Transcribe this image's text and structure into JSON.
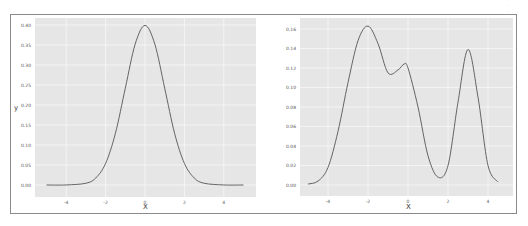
{
  "chart_data": [
    {
      "type": "line",
      "title": "",
      "xlabel": "X",
      "ylabel": "y",
      "xlim": [
        -5.5,
        5.5
      ],
      "ylim": [
        -0.01,
        0.42
      ],
      "grid": true,
      "x_ticks": [
        "-4",
        "-2",
        "0",
        "2",
        "4"
      ],
      "y_ticks": [
        "0.00",
        "0.05",
        "0.10",
        "0.15",
        "0.20",
        "0.25",
        "0.30",
        "0.35",
        "0.40"
      ],
      "series": [
        {
          "name": "standard normal density",
          "x": [
            -5,
            -4,
            -3,
            -2.5,
            -2,
            -1.5,
            -1,
            -0.5,
            0,
            0.5,
            1,
            1.5,
            2,
            2.5,
            3,
            4,
            5
          ],
          "y": [
            0.0,
            0.0001,
            0.0044,
            0.0175,
            0.054,
            0.1295,
            0.242,
            0.352,
            0.399,
            0.352,
            0.242,
            0.1295,
            0.054,
            0.0175,
            0.0044,
            0.0001,
            0.0
          ]
        }
      ]
    },
    {
      "type": "line",
      "title": "",
      "xlabel": "X",
      "ylabel": "",
      "xlim": [
        -5.5,
        5.5
      ],
      "ylim": [
        -0.005,
        0.17
      ],
      "grid": true,
      "x_ticks": [
        "-4",
        "-2",
        "0",
        "2",
        "4"
      ],
      "y_ticks": [
        "0.00",
        "0.02",
        "0.04",
        "0.06",
        "0.08",
        "0.10",
        "0.12",
        "0.14",
        "0.16"
      ],
      "series": [
        {
          "name": "trimodal mixture density",
          "x": [
            -5,
            -4.5,
            -4,
            -3.5,
            -3,
            -2.5,
            -2,
            -1.5,
            -1,
            -0.5,
            -0.2,
            0,
            0.5,
            1,
            1.5,
            2,
            2.5,
            3,
            3.5,
            4,
            4.5
          ],
          "y": [
            0.001,
            0.004,
            0.018,
            0.055,
            0.105,
            0.148,
            0.163,
            0.145,
            0.115,
            0.118,
            0.124,
            0.12,
            0.08,
            0.03,
            0.008,
            0.02,
            0.085,
            0.139,
            0.09,
            0.02,
            0.003
          ]
        }
      ]
    }
  ],
  "left_panel": {
    "ylabel": "y",
    "xlabel": "X",
    "y_ticks": [
      "0.40",
      "0.35",
      "0.30",
      "0.25",
      "0.20",
      "0.15",
      "0.10",
      "0.05",
      "0.00"
    ],
    "x_ticks": [
      "-4",
      "-2",
      "0",
      "2",
      "4"
    ]
  },
  "right_panel": {
    "xlabel": "X",
    "y_ticks": [
      "0.16",
      "0.14",
      "0.12",
      "0.10",
      "0.08",
      "0.06",
      "0.04",
      "0.02",
      "0.00"
    ],
    "x_ticks": [
      "-4",
      "-2",
      "0",
      "2",
      "4"
    ]
  },
  "colors": {
    "panel_bg": "#e6e6e6",
    "grid": "#f7f7f7",
    "line": "#555555"
  }
}
